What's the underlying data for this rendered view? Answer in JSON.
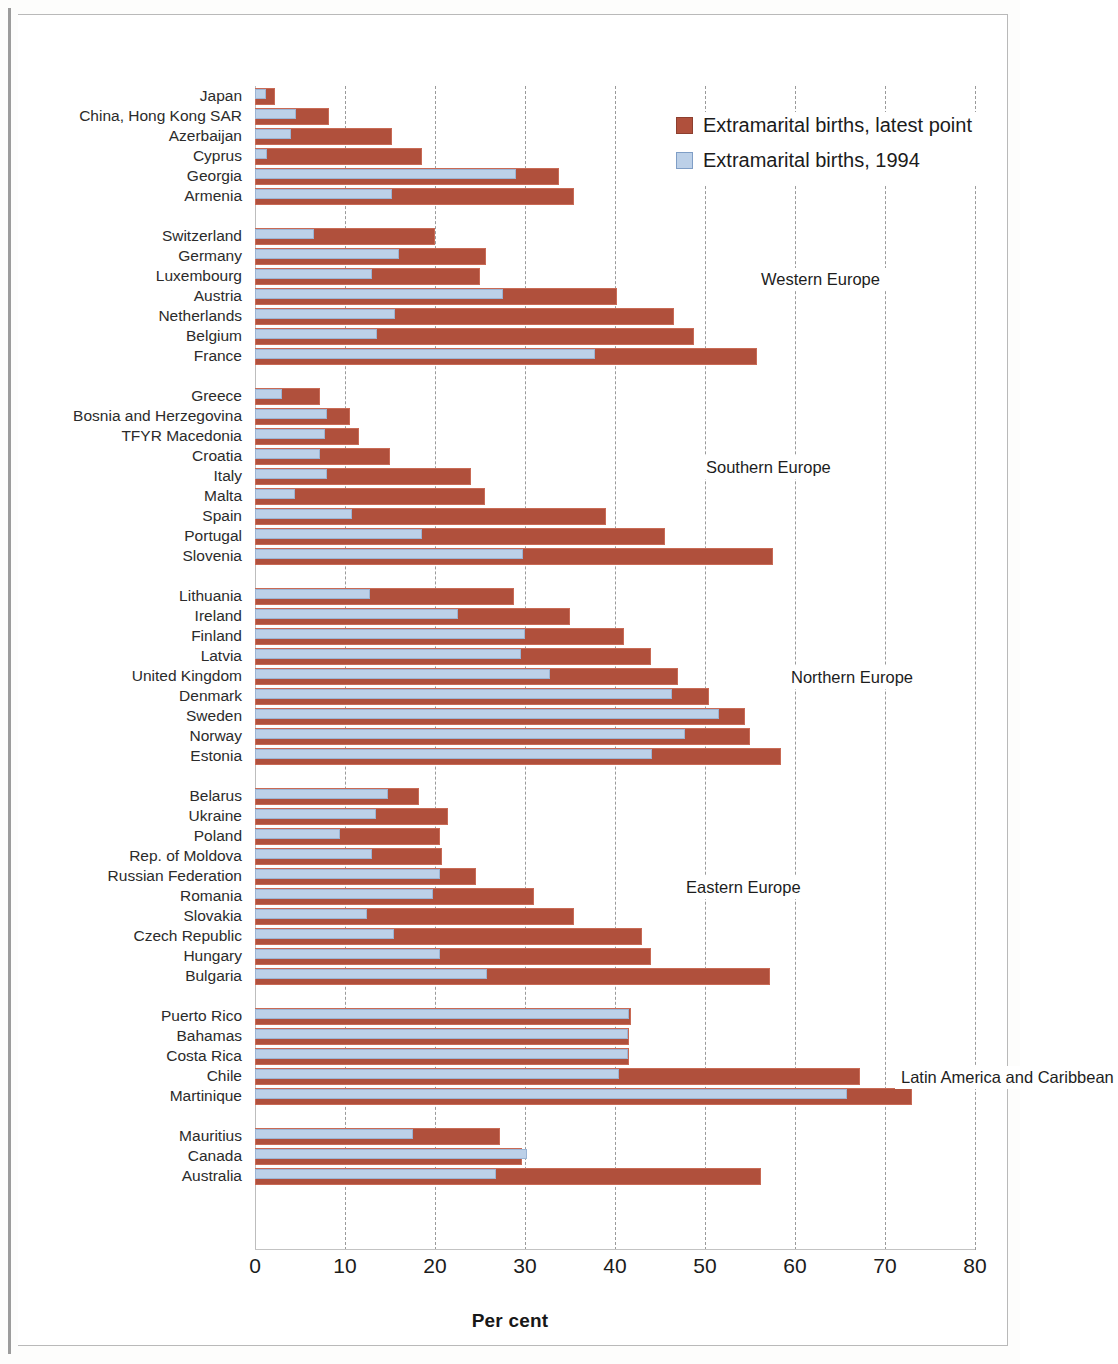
{
  "chart_data": {
    "type": "bar",
    "orientation": "horizontal",
    "title": "",
    "xlabel": "Per cent",
    "ylabel": "",
    "xlim": [
      0,
      80
    ],
    "xticks": [
      0,
      10,
      20,
      30,
      40,
      50,
      60,
      70,
      80
    ],
    "grid": "vertical-dashed",
    "legend_position": "top-right",
    "series": [
      {
        "name": "Extramarital births, latest point",
        "color": "#b0503c"
      },
      {
        "name": "Extramarital births, 1994",
        "color": "#bcd0e8"
      }
    ],
    "group_annotations": [
      "Asia",
      "Western Europe",
      "Southern Europe",
      "Northern Europe",
      "Eastern Europe",
      "Latin America and Caribbean"
    ],
    "groups": [
      {
        "label": "Asia",
        "rows": [
          {
            "category": "Japan",
            "latest": 2.2,
            "y1994": 1.2
          },
          {
            "category": "China, Hong Kong SAR",
            "latest": 8.2,
            "y1994": 4.6
          },
          {
            "category": "Azerbaijan",
            "latest": 15.2,
            "y1994": 4.0
          },
          {
            "category": "Cyprus",
            "latest": 18.6,
            "y1994": 1.3
          },
          {
            "category": "Georgia",
            "latest": 33.8,
            "y1994": 29.0
          },
          {
            "category": "Armenia",
            "latest": 35.4,
            "y1994": 15.2
          }
        ]
      },
      {
        "label": "Western Europe",
        "rows": [
          {
            "category": "Switzerland",
            "latest": 20.0,
            "y1994": 6.5
          },
          {
            "category": "Germany",
            "latest": 25.7,
            "y1994": 16.0
          },
          {
            "category": "Luxembourg",
            "latest": 25.0,
            "y1994": 13.0
          },
          {
            "category": "Austria",
            "latest": 40.2,
            "y1994": 27.5
          },
          {
            "category": "Netherlands",
            "latest": 46.6,
            "y1994": 15.5
          },
          {
            "category": "Belgium",
            "latest": 48.8,
            "y1994": 13.6
          },
          {
            "category": "France",
            "latest": 55.8,
            "y1994": 37.8
          }
        ]
      },
      {
        "label": "Southern Europe",
        "rows": [
          {
            "category": "Greece",
            "latest": 7.2,
            "y1994": 3.0
          },
          {
            "category": "Bosnia and Herzegovina",
            "latest": 10.6,
            "y1994": 8.0
          },
          {
            "category": "TFYR Macedonia",
            "latest": 11.5,
            "y1994": 7.8
          },
          {
            "category": "Croatia",
            "latest": 15.0,
            "y1994": 7.2
          },
          {
            "category": "Italy",
            "latest": 24.0,
            "y1994": 8.0
          },
          {
            "category": "Malta",
            "latest": 25.6,
            "y1994": 4.4
          },
          {
            "category": "Spain",
            "latest": 39.0,
            "y1994": 10.8
          },
          {
            "category": "Portugal",
            "latest": 45.6,
            "y1994": 18.6
          },
          {
            "category": "Slovenia",
            "latest": 57.5,
            "y1994": 29.8
          }
        ]
      },
      {
        "label": "Northern Europe",
        "rows": [
          {
            "category": "Lithuania",
            "latest": 28.8,
            "y1994": 12.8
          },
          {
            "category": "Ireland",
            "latest": 35.0,
            "y1994": 22.5
          },
          {
            "category": "Finland",
            "latest": 41.0,
            "y1994": 30.0
          },
          {
            "category": "Latvia",
            "latest": 44.0,
            "y1994": 29.5
          },
          {
            "category": "United Kingdom",
            "latest": 47.0,
            "y1994": 32.8
          },
          {
            "category": "Denmark",
            "latest": 50.4,
            "y1994": 46.3
          },
          {
            "category": "Sweden",
            "latest": 54.4,
            "y1994": 51.6
          },
          {
            "category": "Norway",
            "latest": 55.0,
            "y1994": 47.8
          },
          {
            "category": "Estonia",
            "latest": 58.4,
            "y1994": 44.1
          }
        ]
      },
      {
        "label": "Eastern Europe",
        "rows": [
          {
            "category": "Belarus",
            "latest": 18.2,
            "y1994": 14.8
          },
          {
            "category": "Ukraine",
            "latest": 21.4,
            "y1994": 13.4
          },
          {
            "category": "Poland",
            "latest": 20.5,
            "y1994": 9.4
          },
          {
            "category": "Rep. of Moldova",
            "latest": 20.8,
            "y1994": 13.0
          },
          {
            "category": "Russian Federation",
            "latest": 24.6,
            "y1994": 20.5
          },
          {
            "category": "Romania",
            "latest": 31.0,
            "y1994": 19.8
          },
          {
            "category": "Slovakia",
            "latest": 35.4,
            "y1994": 12.4
          },
          {
            "category": "Czech Republic",
            "latest": 43.0,
            "y1994": 15.4
          },
          {
            "category": "Hungary",
            "latest": 44.0,
            "y1994": 20.6
          },
          {
            "category": "Bulgaria",
            "latest": 57.2,
            "y1994": 25.8
          }
        ]
      },
      {
        "label": "Latin America and Caribbean",
        "rows": [
          {
            "category": "Puerto Rico",
            "latest": 41.8,
            "y1994": 41.6
          },
          {
            "category": "Bahamas",
            "latest": 41.6,
            "y1994": 41.4
          },
          {
            "category": "Costa Rica",
            "latest": 41.6,
            "y1994": 41.4
          },
          {
            "category": "Chile",
            "latest": 67.2,
            "y1994": 40.4
          },
          {
            "category": "Martinique",
            "latest": 73.0,
            "y1994": 65.8
          }
        ]
      },
      {
        "label": "",
        "rows": [
          {
            "category": "Mauritius",
            "latest": 27.2,
            "y1994": 17.6
          },
          {
            "category": "Canada",
            "latest": 29.7,
            "y1994": 30.2
          },
          {
            "category": "Australia",
            "latest": 56.2,
            "y1994": 26.8
          }
        ]
      }
    ]
  },
  "legend": {
    "items": [
      {
        "label": "Extramarital births, latest point",
        "swatch": "latest"
      },
      {
        "label": "Extramarital births, 1994",
        "swatch": "y1994"
      }
    ]
  },
  "axis": {
    "title": "Per cent",
    "ticks": [
      "0",
      "10",
      "20",
      "30",
      "40",
      "50",
      "60",
      "70",
      "80"
    ]
  }
}
